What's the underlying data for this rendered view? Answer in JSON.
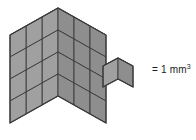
{
  "figure": {
    "background_color": "#ffffff",
    "stroke_color": "#3a3a3a"
  },
  "legend": {
    "equals_sign": "=",
    "value": "1",
    "unit": "mm",
    "exponent": "3",
    "full_text": "= 1 mm³"
  },
  "unit_cube": {
    "label": "unit cube",
    "top_face_color": "#b4b4b4",
    "left_face_color": "#a0a0a0",
    "right_face_color": "#8e8e8e",
    "origin_x": 118,
    "origin_y": 58,
    "cell_width": 15,
    "cell_height": 8,
    "cell_depth": 21
  },
  "cube_stack": {
    "label": "rectangular prism built from unit cubes",
    "columns_x": 3,
    "columns_y": 3,
    "layers_z": 4,
    "total_cubes": 36,
    "volume_value": 36,
    "volume_unit": "mm³",
    "top_face_color": "#b4b4b4",
    "left_face_color": "#a0a0a0",
    "right_face_color": "#8e8e8e",
    "origin_x": 58,
    "origin_y": 8,
    "cell_width": 16,
    "cell_height": 9,
    "cell_depth": 22
  }
}
